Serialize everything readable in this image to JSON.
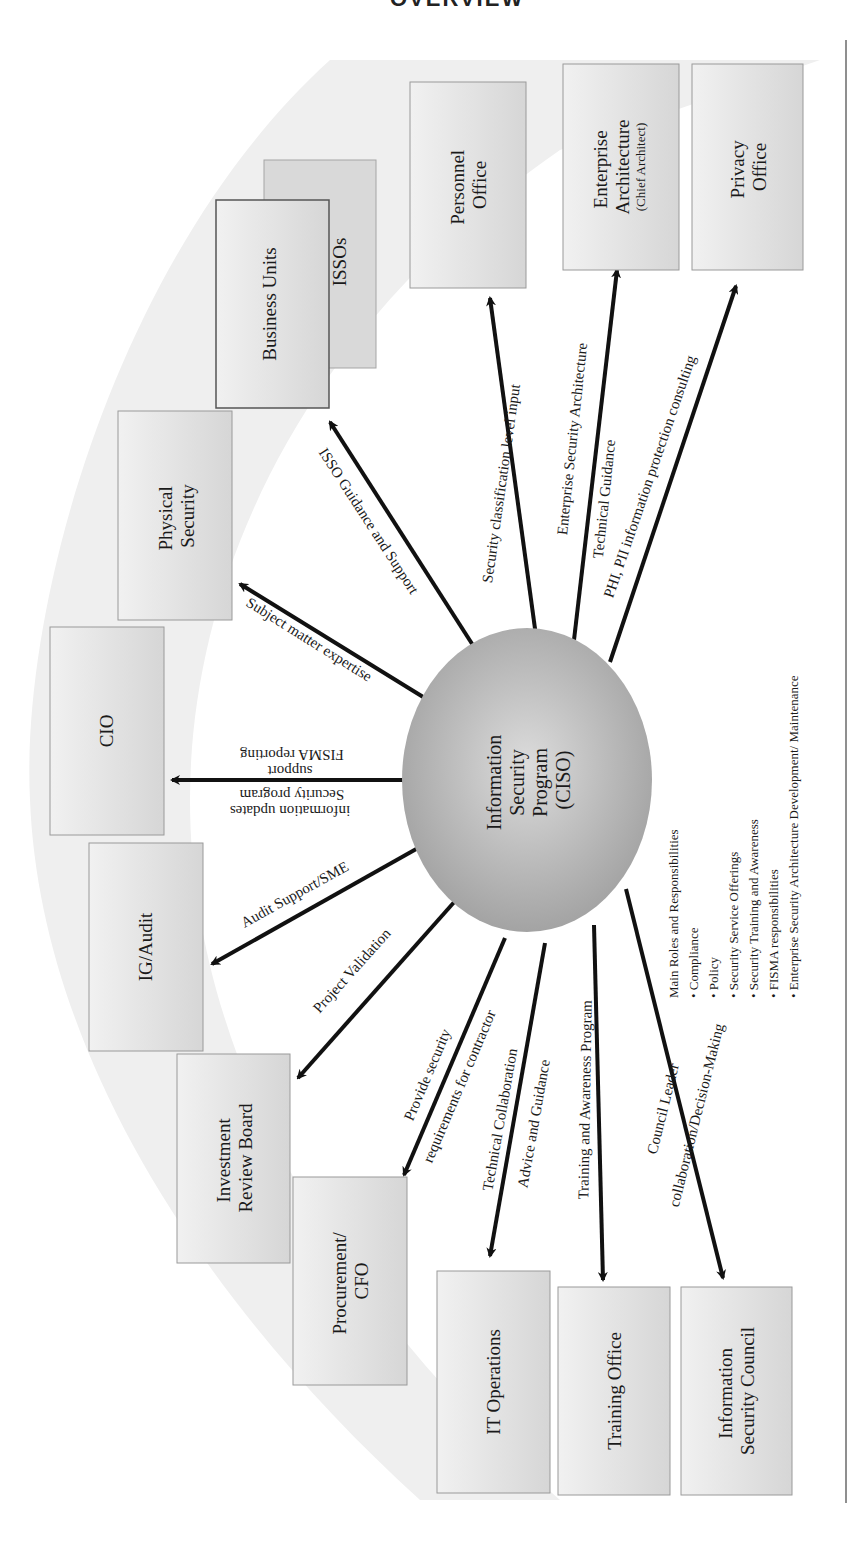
{
  "page": {
    "running_header": "OVERVIEW",
    "page_rule_color": "#6a6a6a"
  },
  "colors": {
    "box_fill": "#e2e2e2",
    "box_border": "#9a9a9a",
    "ellipse_fill": "#b0b0b0",
    "arrow": "#111111",
    "band": "#ededed"
  },
  "center": {
    "lines": [
      "Information",
      "Security",
      "Program",
      "(CISO)"
    ]
  },
  "boxes": [
    {
      "id": "personnel-office",
      "lines": [
        "Personnel",
        "Office"
      ]
    },
    {
      "id": "enterprise-architecture",
      "lines": [
        "Enterprise",
        "Architecture"
      ],
      "sub": "(Chief Architect)"
    },
    {
      "id": "privacy-office",
      "lines": [
        "Privacy",
        "Office"
      ]
    },
    {
      "id": "isso",
      "lines": [
        "ISSOs"
      ]
    },
    {
      "id": "business-units",
      "lines": [
        "Business Units"
      ]
    },
    {
      "id": "physical-security",
      "lines": [
        "Physical",
        "Security"
      ]
    },
    {
      "id": "cio",
      "lines": [
        "CIO"
      ]
    },
    {
      "id": "ig-audit",
      "lines": [
        "IG/Audit"
      ]
    },
    {
      "id": "investment-review-board",
      "lines": [
        "Investment",
        "Review Board"
      ]
    },
    {
      "id": "procurement-cfo",
      "lines": [
        "Procurement/",
        "CFO"
      ]
    },
    {
      "id": "it-operations",
      "lines": [
        "IT Operations"
      ]
    },
    {
      "id": "training-office",
      "lines": [
        "Training Office"
      ]
    },
    {
      "id": "information-security-council",
      "lines": [
        "Information",
        "Security Council"
      ]
    }
  ],
  "edges": [
    {
      "target": "personnel-office",
      "lines": [
        "Security classification level input"
      ]
    },
    {
      "target": "enterprise-architecture",
      "lines": [
        "Enterprise Security Architecture",
        "Technical Guidance"
      ]
    },
    {
      "target": "privacy-office",
      "lines": [
        "PHI, PII information protection consulting"
      ]
    },
    {
      "target": "business-units",
      "lines": [
        "ISSO Guidance and Support"
      ]
    },
    {
      "target": "physical-security",
      "lines": [
        "Subject matter expertise"
      ]
    },
    {
      "target": "cio",
      "lines": [
        "Security program",
        "information updates",
        "FISMA reporting",
        "support"
      ]
    },
    {
      "target": "ig-audit",
      "lines": [
        "Audit Support/SME"
      ]
    },
    {
      "target": "investment-review-board",
      "lines": [
        "Project Validation"
      ]
    },
    {
      "target": "procurement-cfo",
      "lines": [
        "Provide security",
        "requirements for contractor"
      ]
    },
    {
      "target": "it-operations",
      "lines": [
        "Technical Collaboration",
        "Advice and Guidance"
      ]
    },
    {
      "target": "training-office",
      "lines": [
        "Training and Awareness Program"
      ]
    },
    {
      "target": "information-security-council",
      "lines": [
        "Council Leader",
        "collaboration/Decision-Making"
      ]
    }
  ],
  "roles": {
    "title": "Main Roles and Responsibilities",
    "items": [
      "Compliance",
      "Policy",
      "Security Service Offerings",
      "Security Training and Awareness",
      "FISMA responsibilities",
      "Enterprise Security Architecture Development/ Maintenance"
    ]
  }
}
